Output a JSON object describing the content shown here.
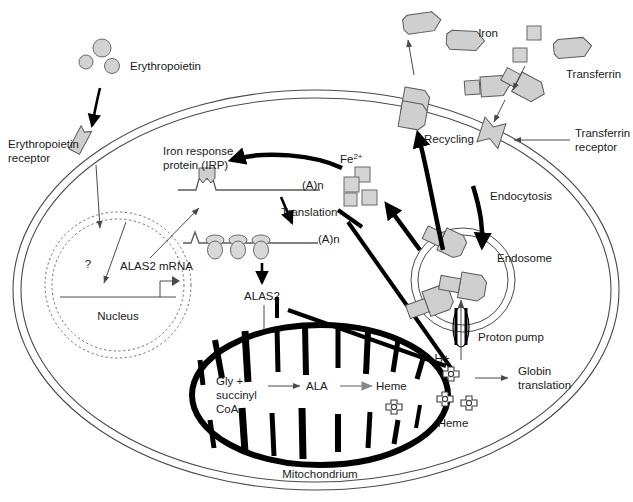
{
  "figure": {
    "domain": "biology-cell-diagram"
  },
  "labels": {
    "erythropoietin": "Erythropoietin",
    "erythropoietin_receptor_line1": "Erythropoietin",
    "erythropoietin_receptor_line2": "receptor",
    "irp_line1": "Iron response",
    "irp_line2": "protein (IRP)",
    "fe2_base": "Fe",
    "fe2_sup": "2+",
    "poly_a_1": "(A)n",
    "poly_a_2": "(A)n",
    "translation": "Translation",
    "alas2_protein": "ALAS2",
    "alas2_mrna": "ALAS2 mRNA",
    "question_mark": "?",
    "nucleus": "Nucleus",
    "gly_line1": "Gly +",
    "gly_line2": "succinyl",
    "gly_line3": "CoA",
    "ala": "ALA",
    "heme_mito": "Heme",
    "mitochondrium": "Mitochondrium",
    "iron": "Iron",
    "transferrin": "Transferrin",
    "transferrin_receptor_line1": "Transferrin",
    "transferrin_receptor_line2": "receptor",
    "recycling": "Recycling",
    "endocytosis": "Endocytosis",
    "endosome": "Endosome",
    "proton_pump": "Proton pump",
    "proton": "H+",
    "heme_cytosol": "Heme",
    "globin_line1": "Globin",
    "globin_line2": "translation"
  },
  "colors": {
    "background": "#ffffff",
    "membrane_stroke": "#4a4a4a",
    "organelle_fill": "#cfcfcf",
    "organelle_stroke": "#5a5a5a",
    "mitochondrion_stroke": "#000000",
    "arrow_black": "#000000",
    "arrow_thin": "#4a4a4a",
    "nucleus_dash": "#6a6a6a",
    "text": "#1a1a1a",
    "heme_outline": "#3a3a3a",
    "gray_arrow": "#9a9a9a"
  },
  "structures": {
    "cell_membrane": "double-line ellipse",
    "nuclear_membrane": "double dashed circle",
    "mitochondrion": "thick-walled ellipse with cristae",
    "endosome": "double circle with embedded transferrin-receptor complexes",
    "ribosomes": 3,
    "epo_molecules": 3,
    "iron_squares_extracellular": 2,
    "fe2_squares_cytosolic": 4,
    "heme_molecules_cytosolic": 3,
    "heme_molecules_mitochondrial": 1,
    "transferrin_extracellular": 4,
    "transferrin_in_endosome": 3
  },
  "pathway_steps": [
    "Erythropoietin binds erythropoietin receptor",
    "Signal to nucleus (?) induces ALAS2 mRNA transcription",
    "Iron-loaded transferrin binds transferrin receptor",
    "Endocytosis forms endosome",
    "Proton pump acidifies endosome, releasing Fe2+",
    "Transferrin receptor recycling to membrane",
    "Fe2+ removes IRP from ALAS2 mRNA iron response element",
    "Translation of ALAS2 mRNA by ribosomes",
    "ALAS2 enters mitochondrion",
    "Gly + succinyl CoA to ALA to Heme",
    "Heme inhibits Translation and ALAS2 (feedback)",
    "Heme drives globin translation"
  ]
}
